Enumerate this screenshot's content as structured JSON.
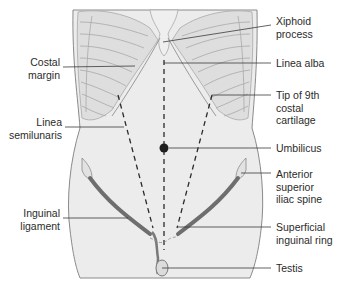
{
  "diagram": {
    "colors": {
      "skin": "#ececec",
      "outline": "#8a8a8a",
      "rib": "#d6d6d6",
      "rib_line": "#a8a8a8",
      "ligament": "#6e6e6e",
      "leader": "#3a3a3a",
      "dashed": "#2a2a2a",
      "text": "#2b2b2b"
    },
    "labels_left": [
      {
        "id": "costal-margin",
        "text": "Costal\nmargin"
      },
      {
        "id": "linea-semilunaris",
        "text": "Linea\nsemilunaris"
      },
      {
        "id": "inguinal-ligament",
        "text": "Inguinal\nligament"
      }
    ],
    "labels_right": [
      {
        "id": "xiphoid-process",
        "text": "Xiphoid\nprocess"
      },
      {
        "id": "linea-alba",
        "text": "Linea alba"
      },
      {
        "id": "tip-9th-costal-cartilage",
        "text": "Tip of 9th\ncostal\ncartilage"
      },
      {
        "id": "umbilicus",
        "text": "Umbilicus"
      },
      {
        "id": "anterior-superior-iliac-spine",
        "text": "Anterior\nsuperior\niliac spine"
      },
      {
        "id": "superficial-inguinal-ring",
        "text": "Superficial\ninguinal ring"
      },
      {
        "id": "testis",
        "text": "Testis"
      }
    ]
  }
}
